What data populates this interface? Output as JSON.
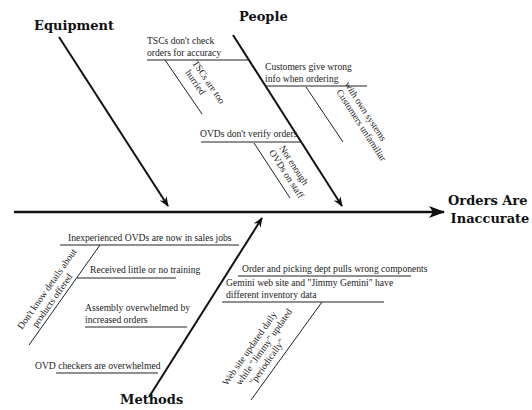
{
  "diagram": {
    "type": "fishbone",
    "effect": [
      "Orders Are",
      "Inaccurate"
    ],
    "categories": {
      "equipment": "Equipment",
      "people": "People",
      "methods": "Methods"
    },
    "people_causes": [
      {
        "text": [
          "TSCs don't check",
          "orders for accuracy"
        ],
        "sub": [
          "TSCs are too",
          "hurried"
        ]
      },
      {
        "text": [
          "Customers give wrong",
          "info when ordering"
        ],
        "sub": [
          "Customers unfamiliar",
          "with own systems"
        ]
      },
      {
        "text": [
          "OVDs don't verify orders"
        ],
        "sub": [
          "Not enough",
          "OVDs on staff"
        ]
      }
    ],
    "methods_causes": [
      {
        "text": [
          "Inexperienced OVDs are now in sales jobs"
        ],
        "sub": [
          "Don't know details about",
          "products offered"
        ]
      },
      {
        "text": [
          "Received little or no training"
        ]
      },
      {
        "text": [
          "Assembly overwhelmed by",
          "increased orders"
        ]
      },
      {
        "text": [
          "OVD checkers are overwhelmed"
        ]
      },
      {
        "text": [
          "Order and picking dept pulls wrong components"
        ]
      },
      {
        "text": [
          "Gemini web site and \"Jimmy Gemini\" have",
          "different inventory data"
        ],
        "sub": [
          "Web site updated daily",
          "while \"Jimmy\" updated",
          "\"periodically\""
        ]
      }
    ]
  }
}
